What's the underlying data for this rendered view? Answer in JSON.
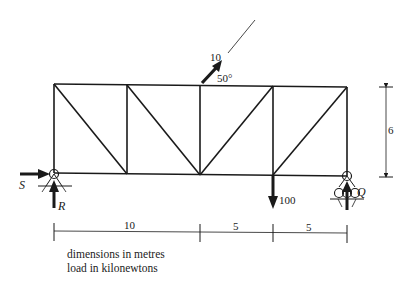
{
  "title": "",
  "truss": {
    "type": "Pratt-style truss, 4 panels",
    "height_label": "6",
    "span_labels": [
      "10",
      "5",
      "5"
    ],
    "members_color": "#1a1a1a"
  },
  "loads": {
    "inclined": {
      "magnitude": "10",
      "angle": "50°"
    },
    "vertical": {
      "magnitude": "100"
    }
  },
  "reactions": {
    "left_horizontal": "S",
    "left_vertical": "R",
    "right_vertical": "Q"
  },
  "notes": {
    "line1": "dimensions in metres",
    "line2": "load in kilonewtons"
  }
}
